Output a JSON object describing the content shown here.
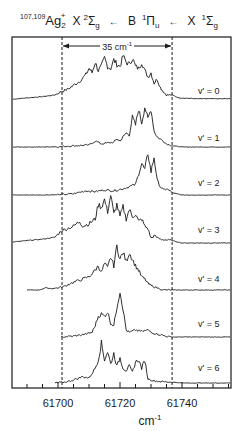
{
  "chart_data": {
    "type": "line",
    "title_parts": {
      "isotopes": "107,109",
      "species": "Ag",
      "subscript": "2",
      "charge": "+",
      "state1": "X",
      "state1_mult": "2",
      "state1_sym": "Σ",
      "state1_sub": "g",
      "arrow1": "←",
      "state2": "B",
      "state2_mult": "1",
      "state2_sym": "Π",
      "state2_sub": "u",
      "arrow2": "←",
      "state3": "X",
      "state3_mult": "1",
      "state3_sym": "Σ",
      "state3_sub": "g"
    },
    "xlabel": "cm",
    "xlabel_sup": "-1",
    "ylabel": "",
    "xlim": [
      61685,
      61756
    ],
    "xticks_major": [
      61700,
      61720,
      61740
    ],
    "xtick_labels": [
      "61700",
      "61720",
      "61740"
    ],
    "xtick_minor_step": 5,
    "grid": false,
    "legend": "none",
    "annotation": {
      "text": "35 cm",
      "sup": "-1",
      "from": 61701.3,
      "to": 61736.8,
      "style": "double-arrow between dashed vertical lines"
    },
    "dashed_lines_x": [
      61701.3,
      61736.8
    ],
    "series": [
      {
        "name": "v' = 0",
        "label": "v' = 0",
        "x_start": 61685.5,
        "x_end": 61755.5,
        "points": [
          [
            61685.5,
            0.02
          ],
          [
            61690,
            0.05
          ],
          [
            61695,
            0.08
          ],
          [
            61699,
            0.12
          ],
          [
            61701,
            0.2
          ],
          [
            61703,
            0.25
          ],
          [
            61705,
            0.35
          ],
          [
            61707,
            0.45
          ],
          [
            61709,
            0.6
          ],
          [
            61710,
            0.75
          ],
          [
            61711,
            0.65
          ],
          [
            61712,
            0.9
          ],
          [
            61713,
            0.7
          ],
          [
            61714,
            0.8
          ],
          [
            61715,
            1.0
          ],
          [
            61716,
            0.8
          ],
          [
            61717,
            0.75
          ],
          [
            61718,
            0.95
          ],
          [
            61719,
            0.85
          ],
          [
            61720,
            0.8
          ],
          [
            61721,
            1.05
          ],
          [
            61722,
            0.9
          ],
          [
            61723,
            0.85
          ],
          [
            61724,
            1.0
          ],
          [
            61725,
            0.8
          ],
          [
            61726,
            0.75
          ],
          [
            61727,
            0.9
          ],
          [
            61728,
            0.7
          ],
          [
            61729,
            0.55
          ],
          [
            61730,
            0.65
          ],
          [
            61731,
            0.4
          ],
          [
            61732,
            0.5
          ],
          [
            61733,
            0.3
          ],
          [
            61734,
            0.2
          ],
          [
            61735,
            0.12
          ],
          [
            61736.8,
            0.12
          ],
          [
            61739,
            0.05
          ],
          [
            61745,
            0.03
          ],
          [
            61755.5,
            0.03
          ]
        ]
      },
      {
        "name": "v' = 1",
        "label": "v' = 1",
        "x_start": 61685.5,
        "x_end": 61755.5,
        "points": [
          [
            61685.5,
            0.0
          ],
          [
            61695,
            0.0
          ],
          [
            61701,
            0.01
          ],
          [
            61705,
            0.03
          ],
          [
            61710,
            0.05
          ],
          [
            61712,
            0.15
          ],
          [
            61714,
            0.08
          ],
          [
            61716,
            0.1
          ],
          [
            61718,
            0.12
          ],
          [
            61719,
            0.2
          ],
          [
            61720,
            0.15
          ],
          [
            61721,
            0.25
          ],
          [
            61722,
            0.35
          ],
          [
            61723,
            0.3
          ],
          [
            61724,
            0.75
          ],
          [
            61725,
            0.55
          ],
          [
            61726,
            0.95
          ],
          [
            61727,
            0.6
          ],
          [
            61728,
            1.0
          ],
          [
            61729,
            0.7
          ],
          [
            61730,
            0.95
          ],
          [
            61731,
            0.4
          ],
          [
            61732,
            0.25
          ],
          [
            61733,
            0.2
          ],
          [
            61734,
            0.15
          ],
          [
            61735,
            0.08
          ],
          [
            61737,
            0.03
          ],
          [
            61740,
            0.0
          ],
          [
            61755.5,
            0.0
          ]
        ]
      },
      {
        "name": "v' = 2",
        "label": "v' = 2",
        "x_start": 61685.5,
        "x_end": 61755.5,
        "points": [
          [
            61685.5,
            0.0
          ],
          [
            61695,
            0.0
          ],
          [
            61701,
            0.01
          ],
          [
            61705,
            0.03
          ],
          [
            61709,
            0.1
          ],
          [
            61712,
            0.08
          ],
          [
            61715,
            0.12
          ],
          [
            61718,
            0.1
          ],
          [
            61721,
            0.15
          ],
          [
            61723,
            0.2
          ],
          [
            61725,
            0.25
          ],
          [
            61726,
            0.5
          ],
          [
            61727,
            0.75
          ],
          [
            61728,
            0.6
          ],
          [
            61729,
            1.0
          ],
          [
            61730,
            0.55
          ],
          [
            61731,
            0.9
          ],
          [
            61732,
            0.35
          ],
          [
            61733,
            0.2
          ],
          [
            61734,
            0.12
          ],
          [
            61735,
            0.15
          ],
          [
            61737,
            0.05
          ],
          [
            61740,
            0.0
          ],
          [
            61755.5,
            0.0
          ]
        ]
      },
      {
        "name": "v' = 3",
        "label": "v' = 3",
        "x_start": 61685.5,
        "x_end": 61755.5,
        "points": [
          [
            61685.5,
            0.02
          ],
          [
            61690,
            0.05
          ],
          [
            61695,
            0.08
          ],
          [
            61699,
            0.12
          ],
          [
            61701,
            0.25
          ],
          [
            61703,
            0.3
          ],
          [
            61705,
            0.35
          ],
          [
            61707,
            0.45
          ],
          [
            61708,
            0.35
          ],
          [
            61710,
            0.4
          ],
          [
            61711,
            0.45
          ],
          [
            61712,
            0.5
          ],
          [
            61713,
            0.8
          ],
          [
            61714,
            0.75
          ],
          [
            61715,
            0.9
          ],
          [
            61716,
            0.65
          ],
          [
            61717,
            1.0
          ],
          [
            61718,
            0.6
          ],
          [
            61719,
            0.8
          ],
          [
            61720,
            0.55
          ],
          [
            61721,
            0.75
          ],
          [
            61722,
            0.5
          ],
          [
            61723,
            0.7
          ],
          [
            61724,
            0.55
          ],
          [
            61725,
            0.6
          ],
          [
            61726,
            0.45
          ],
          [
            61727,
            0.5
          ],
          [
            61728,
            0.35
          ],
          [
            61729,
            0.3
          ],
          [
            61730,
            0.1
          ],
          [
            61731,
            0.15
          ],
          [
            61733,
            0.08
          ],
          [
            61736.8,
            0.05
          ],
          [
            61740,
            0.0
          ],
          [
            61755.5,
            0.0
          ]
        ]
      },
      {
        "name": "v' = 4",
        "label": "v' = 4",
        "x_start": 61690,
        "x_end": 61755.5,
        "points": [
          [
            61690,
            0.0
          ],
          [
            61694,
            0.0
          ],
          [
            61696,
            0.05
          ],
          [
            61698,
            0.03
          ],
          [
            61700,
            0.05
          ],
          [
            61702,
            0.08
          ],
          [
            61704,
            0.15
          ],
          [
            61706,
            0.2
          ],
          [
            61708,
            0.25
          ],
          [
            61710,
            0.3
          ],
          [
            61712,
            0.45
          ],
          [
            61713,
            0.55
          ],
          [
            61714,
            0.4
          ],
          [
            61715,
            0.6
          ],
          [
            61716,
            0.5
          ],
          [
            61717,
            0.75
          ],
          [
            61718,
            0.55
          ],
          [
            61719,
            1.0
          ],
          [
            61720,
            0.7
          ],
          [
            61721,
            0.85
          ],
          [
            61722,
            0.65
          ],
          [
            61723,
            0.85
          ],
          [
            61724,
            0.7
          ],
          [
            61725,
            0.55
          ],
          [
            61726,
            0.45
          ],
          [
            61727,
            0.3
          ],
          [
            61728,
            0.25
          ],
          [
            61729,
            0.15
          ],
          [
            61730,
            0.1
          ],
          [
            61732,
            0.05
          ],
          [
            61734,
            0.0
          ],
          [
            61736,
            0.0
          ],
          [
            61755.5,
            0.0
          ]
        ]
      },
      {
        "name": "v' = 5",
        "label": "v' = 5",
        "x_start": 61701,
        "x_end": 61755.5,
        "points": [
          [
            61701,
            0.0
          ],
          [
            61705,
            0.02
          ],
          [
            61708,
            0.05
          ],
          [
            61710,
            0.08
          ],
          [
            61711,
            0.1
          ],
          [
            61712,
            0.25
          ],
          [
            61713,
            0.45
          ],
          [
            61714,
            0.5
          ],
          [
            61715,
            0.45
          ],
          [
            61716,
            0.55
          ],
          [
            61717,
            0.3
          ],
          [
            61718,
            0.25
          ],
          [
            61719,
            0.65
          ],
          [
            61720,
            1.0
          ],
          [
            61721,
            0.6
          ],
          [
            61722,
            0.15
          ],
          [
            61723,
            0.1
          ],
          [
            61725,
            0.15
          ],
          [
            61727,
            0.12
          ],
          [
            61729,
            0.15
          ],
          [
            61731,
            0.08
          ],
          [
            61733,
            0.05
          ],
          [
            61736,
            0.0
          ],
          [
            61740,
            0.0
          ],
          [
            61755.5,
            0.0
          ]
        ]
      },
      {
        "name": "v' = 6",
        "label": "v' = 6",
        "x_start": 61699,
        "x_end": 61755.5,
        "points": [
          [
            61699,
            0.0
          ],
          [
            61702,
            0.02
          ],
          [
            61704,
            0.05
          ],
          [
            61706,
            0.1
          ],
          [
            61708,
            0.15
          ],
          [
            61710,
            0.12
          ],
          [
            61712,
            0.35
          ],
          [
            61713,
            0.55
          ],
          [
            61714,
            0.95
          ],
          [
            61715,
            0.55
          ],
          [
            61716,
            0.75
          ],
          [
            61717,
            0.45
          ],
          [
            61718,
            0.7
          ],
          [
            61719,
            0.4
          ],
          [
            61720,
            0.6
          ],
          [
            61721,
            0.35
          ],
          [
            61722,
            0.3
          ],
          [
            61723,
            0.4
          ],
          [
            61724,
            0.25
          ],
          [
            61725,
            0.5
          ],
          [
            61726,
            0.55
          ],
          [
            61727,
            0.35
          ],
          [
            61728,
            0.55
          ],
          [
            61729,
            0.1
          ],
          [
            61731,
            0.05
          ],
          [
            61734,
            0.03
          ],
          [
            61737,
            0.02
          ],
          [
            61740,
            0.0
          ],
          [
            61755.5,
            0.0
          ]
        ]
      }
    ]
  },
  "layout": {
    "frame": {
      "left": 12,
      "right": 231,
      "top": 37,
      "bottom": 388
    },
    "x_ref_px": 58,
    "x_ref_val": 61700,
    "px_per_unit": 3.1,
    "baselines_px": [
      100,
      147,
      195,
      243,
      290,
      337,
      383
    ],
    "amplitudes_px": [
      42,
      40,
      42,
      48,
      44,
      46,
      42
    ],
    "label_x_px": 198,
    "label_y_px": [
      90,
      137,
      182,
      229,
      278,
      323,
      367
    ]
  },
  "colors": {
    "line": "#1a1a1a",
    "background": "#ffffff"
  }
}
